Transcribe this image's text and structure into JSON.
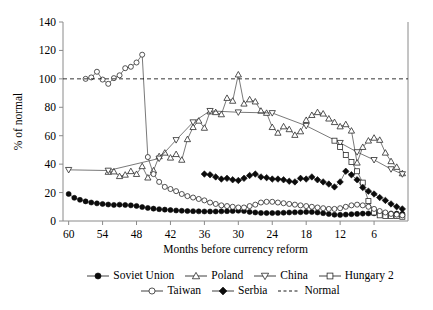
{
  "chart_data": {
    "type": "line",
    "title": "",
    "xlabel": "Months before currency reform",
    "ylabel": "% of normal",
    "xlim": [
      61,
      0
    ],
    "ylim": [
      0,
      140
    ],
    "x_ticks": [
      60,
      54,
      48,
      42,
      36,
      30,
      24,
      18,
      12,
      6
    ],
    "y_ticks": [
      0,
      20,
      40,
      60,
      80,
      100,
      120,
      140
    ],
    "x_axis_inverted": true,
    "grid": false,
    "legend_position": "below",
    "series": [
      {
        "name": "Soviet Union",
        "marker": "filled-circle",
        "points": [
          [
            60,
            19.0
          ],
          [
            59,
            16.3
          ],
          [
            58,
            14.9
          ],
          [
            57,
            13.8
          ],
          [
            56,
            13.0
          ],
          [
            55,
            12.4
          ],
          [
            54,
            12.0
          ],
          [
            53,
            11.6
          ],
          [
            52,
            11.3
          ],
          [
            51,
            11.5
          ],
          [
            50,
            11.3
          ],
          [
            49,
            11.0
          ],
          [
            48,
            10.6
          ],
          [
            47,
            9.8
          ],
          [
            46,
            9.2
          ],
          [
            45,
            8.7
          ],
          [
            44,
            8.3
          ],
          [
            43,
            8.0
          ],
          [
            42,
            7.7
          ],
          [
            41,
            7.4
          ],
          [
            40,
            7.2
          ],
          [
            39,
            7.0
          ],
          [
            38,
            6.9
          ],
          [
            37,
            6.8
          ],
          [
            36,
            6.7
          ],
          [
            35,
            6.7
          ],
          [
            34,
            6.7
          ],
          [
            33,
            6.8
          ],
          [
            32,
            6.9
          ],
          [
            31,
            7.0
          ],
          [
            30,
            7.2
          ],
          [
            29,
            7.0
          ],
          [
            28,
            6.4
          ],
          [
            27,
            6.0
          ],
          [
            26,
            5.7
          ],
          [
            25,
            5.6
          ],
          [
            24,
            5.6
          ],
          [
            23,
            5.7
          ],
          [
            22,
            5.8
          ],
          [
            21,
            6.0
          ],
          [
            20,
            6.1
          ],
          [
            19,
            6.2
          ],
          [
            18,
            6.4
          ],
          [
            17,
            6.3
          ],
          [
            16,
            6.0
          ],
          [
            15,
            5.5
          ],
          [
            14,
            4.9
          ],
          [
            13,
            4.4
          ],
          [
            12,
            4.3
          ],
          [
            11,
            4.5
          ],
          [
            10,
            4.8
          ],
          [
            9,
            5.0
          ],
          [
            8,
            5.2
          ],
          [
            7,
            5.3
          ],
          [
            6,
            5.4
          ],
          [
            5,
            5.4
          ],
          [
            4,
            5.4
          ],
          [
            3,
            5.3
          ],
          [
            2,
            5.2
          ],
          [
            1,
            5.0
          ]
        ]
      },
      {
        "name": "Poland",
        "marker": "open-triangle-up",
        "points": [
          [
            53,
            34.5
          ],
          [
            52,
            34.8
          ],
          [
            51,
            31.5
          ],
          [
            50,
            32.5
          ],
          [
            49,
            35.0
          ],
          [
            48,
            33.0
          ],
          [
            47,
            38.5
          ],
          [
            46,
            30.5
          ],
          [
            45,
            35.5
          ],
          [
            44,
            45.5
          ],
          [
            43,
            48.0
          ],
          [
            42,
            44.5
          ],
          [
            41,
            47.0
          ],
          [
            40,
            43.0
          ],
          [
            39,
            57.5
          ],
          [
            38,
            66.0
          ],
          [
            37,
            70.5
          ],
          [
            36,
            65.5
          ],
          [
            35,
            77.0
          ],
          [
            34,
            76.5
          ],
          [
            33,
            75.0
          ],
          [
            32,
            86.5
          ],
          [
            31,
            84.5
          ],
          [
            30,
            103.0
          ],
          [
            29,
            82.5
          ],
          [
            28,
            85.5
          ],
          [
            27,
            84.0
          ],
          [
            26,
            77.5
          ],
          [
            25,
            76.0
          ],
          [
            24,
            66.0
          ],
          [
            23,
            62.0
          ],
          [
            22,
            66.5
          ],
          [
            21,
            64.5
          ],
          [
            20,
            60.5
          ],
          [
            19,
            63.0
          ],
          [
            18,
            71.0
          ],
          [
            17,
            74.5
          ],
          [
            16,
            76.5
          ],
          [
            15,
            75.5
          ],
          [
            14,
            72.0
          ],
          [
            13,
            69.5
          ],
          [
            12,
            66.5
          ],
          [
            11,
            68.0
          ],
          [
            10,
            63.5
          ],
          [
            9,
            41.0
          ],
          [
            8,
            52.0
          ],
          [
            7,
            56.5
          ],
          [
            6,
            58.5
          ],
          [
            5,
            57.0
          ],
          [
            4,
            48.0
          ],
          [
            3,
            42.0
          ],
          [
            2,
            38.0
          ],
          [
            1,
            33.5
          ]
        ]
      },
      {
        "name": "China",
        "marker": "open-triangle-down",
        "points": [
          [
            60,
            36.0
          ],
          [
            53,
            35.5
          ],
          [
            44,
            44.0
          ],
          [
            41,
            57.0
          ],
          [
            38,
            69.5
          ],
          [
            35,
            77.5
          ],
          [
            30,
            76.5
          ],
          [
            24,
            76.0
          ],
          [
            18,
            67.0
          ],
          [
            12,
            55.0
          ],
          [
            9,
            48.5
          ],
          [
            6,
            43.0
          ],
          [
            3,
            36.5
          ],
          [
            1,
            33.0
          ]
        ]
      },
      {
        "name": "Hungary 2",
        "marker": "open-square",
        "points": [
          [
            13,
            56.5
          ],
          [
            12,
            52.0
          ],
          [
            11,
            46.5
          ],
          [
            10,
            41.5
          ],
          [
            9,
            35.0
          ],
          [
            8,
            27.0
          ],
          [
            7,
            14.0
          ],
          [
            6,
            6.0
          ],
          [
            5,
            4.0
          ],
          [
            4,
            3.5
          ],
          [
            3,
            3.5
          ],
          [
            2,
            3.5
          ],
          [
            1,
            3.0
          ]
        ]
      },
      {
        "name": "Taiwan",
        "marker": "open-circle",
        "points": [
          [
            57,
            100.0
          ],
          [
            56,
            101.0
          ],
          [
            55,
            105.0
          ],
          [
            54,
            99.5
          ],
          [
            53,
            96.5
          ],
          [
            52,
            100.5
          ],
          [
            51,
            102.5
          ],
          [
            50,
            107.5
          ],
          [
            49,
            108.5
          ],
          [
            48,
            111.5
          ],
          [
            47,
            117.0
          ],
          [
            46,
            45.0
          ],
          [
            45,
            33.0
          ],
          [
            44,
            27.5
          ],
          [
            43,
            24.0
          ],
          [
            42,
            22.5
          ],
          [
            41,
            21.0
          ],
          [
            40,
            19.0
          ],
          [
            39,
            17.5
          ],
          [
            38,
            16.5
          ],
          [
            37,
            15.5
          ],
          [
            36,
            14.5
          ],
          [
            35,
            13.0
          ],
          [
            34,
            12.0
          ],
          [
            33,
            11.0
          ],
          [
            32,
            10.5
          ],
          [
            31,
            10.0
          ],
          [
            30,
            9.5
          ],
          [
            29,
            9.5
          ],
          [
            28,
            10.5
          ],
          [
            27,
            11.5
          ],
          [
            26,
            13.0
          ],
          [
            25,
            13.5
          ],
          [
            24,
            13.5
          ],
          [
            23,
            13.0
          ],
          [
            22,
            12.5
          ],
          [
            21,
            12.0
          ],
          [
            20,
            11.5
          ],
          [
            19,
            11.0
          ],
          [
            18,
            10.5
          ],
          [
            17,
            10.0
          ],
          [
            16,
            9.5
          ],
          [
            15,
            9.0
          ],
          [
            14,
            8.5
          ],
          [
            13,
            8.5
          ],
          [
            12,
            9.0
          ],
          [
            11,
            10.0
          ],
          [
            10,
            11.0
          ],
          [
            9,
            11.5
          ],
          [
            8,
            11.0
          ],
          [
            7,
            10.0
          ],
          [
            6,
            8.5
          ],
          [
            5,
            7.0
          ],
          [
            4,
            6.0
          ],
          [
            3,
            5.0
          ],
          [
            2,
            4.5
          ],
          [
            1,
            4.0
          ]
        ]
      },
      {
        "name": "Serbia",
        "marker": "filled-diamond",
        "points": [
          [
            36,
            33.0
          ],
          [
            35,
            32.5
          ],
          [
            34,
            31.0
          ],
          [
            33,
            29.5
          ],
          [
            32,
            30.0
          ],
          [
            31,
            29.0
          ],
          [
            30,
            28.5
          ],
          [
            29,
            30.0
          ],
          [
            28,
            32.0
          ],
          [
            27,
            33.0
          ],
          [
            26,
            31.0
          ],
          [
            25,
            30.5
          ],
          [
            24,
            29.5
          ],
          [
            23,
            29.5
          ],
          [
            22,
            29.0
          ],
          [
            21,
            28.0
          ],
          [
            20,
            27.5
          ],
          [
            19,
            30.0
          ],
          [
            18,
            29.5
          ],
          [
            17,
            31.0
          ],
          [
            16,
            29.0
          ],
          [
            15,
            27.5
          ],
          [
            14,
            26.0
          ],
          [
            13,
            24.0
          ],
          [
            12,
            27.5
          ],
          [
            11,
            35.0
          ],
          [
            10,
            32.5
          ],
          [
            9,
            29.0
          ],
          [
            8,
            23.5
          ],
          [
            7,
            21.0
          ],
          [
            6,
            19.0
          ],
          [
            5,
            16.5
          ],
          [
            4,
            14.5
          ],
          [
            3,
            12.0
          ],
          [
            2,
            10.0
          ],
          [
            1,
            8.5
          ]
        ]
      },
      {
        "name": "Normal",
        "marker": "dashed-line",
        "constant": 100,
        "points": []
      }
    ]
  },
  "axes": {
    "y_title": "% of normal",
    "x_title": "Months before currency reform",
    "y_tick_labels": [
      "0",
      "20",
      "40",
      "60",
      "80",
      "100",
      "120",
      "140"
    ],
    "x_tick_labels": [
      "60",
      "54",
      "48",
      "42",
      "36",
      "30",
      "24",
      "18",
      "12",
      "6"
    ]
  },
  "legend": {
    "row1": [
      {
        "label": "Soviet Union",
        "marker": "filled-circle"
      },
      {
        "label": "Poland",
        "marker": "open-triangle-up"
      },
      {
        "label": "China",
        "marker": "open-triangle-down"
      },
      {
        "label": "Hungary 2",
        "marker": "open-square"
      }
    ],
    "row2": [
      {
        "label": "Taiwan",
        "marker": "open-circle"
      },
      {
        "label": "Serbia",
        "marker": "filled-diamond"
      },
      {
        "label": "Normal",
        "marker": "dashed-line"
      }
    ]
  },
  "colors": {
    "axis": "#8a8a8a",
    "line": "#3f3f3f",
    "marker_fill": "#0b0b0b",
    "marker_open": "#ffffff",
    "text": "#000000"
  }
}
